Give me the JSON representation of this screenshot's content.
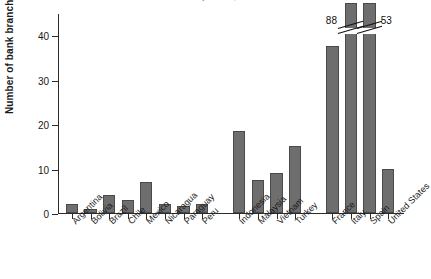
{
  "chart_data": {
    "type": "bar",
    "title": "Bank branches per 100,000 adults",
    "xlabel": "",
    "ylabel": "Number of bank branches",
    "ylim": [
      0,
      45
    ],
    "yticks": [
      0,
      10,
      20,
      30,
      40
    ],
    "grid": false,
    "legend": null,
    "bar_color": "#6e6e6e",
    "categories": [
      "Argentina",
      "Bolivia",
      "Brazil",
      "Chile",
      "Mexico",
      "Nicaragua",
      "Paraguay",
      "Peru",
      "Indonesia",
      "Malaysia",
      "Vietnam",
      "Turkey",
      "France",
      "Italy",
      "Spain",
      "United States"
    ],
    "values": [
      2,
      1,
      4,
      3,
      7,
      2,
      1.5,
      2,
      18.5,
      7.5,
      9,
      15,
      37.5,
      88,
      53,
      10
    ],
    "groups": [
      {
        "name": "Latin America",
        "members": [
          "Argentina",
          "Bolivia",
          "Brazil",
          "Chile",
          "Mexico",
          "Nicaragua",
          "Paraguay",
          "Peru"
        ]
      },
      {
        "name": "Asia",
        "members": [
          "Indonesia",
          "Malaysia",
          "Vietnam",
          "Turkey"
        ]
      },
      {
        "name": "High income",
        "members": [
          "France",
          "Italy",
          "Spain",
          "United States"
        ]
      }
    ],
    "annotations": [
      {
        "label": "88",
        "category": "Italy",
        "note": "axis break, true value above plot range"
      },
      {
        "label": "53",
        "category": "Spain",
        "note": "axis break, true value above plot range"
      }
    ]
  },
  "axis": {
    "y_title": "Number of bank branches",
    "tick_labels": [
      "0",
      "10",
      "20",
      "30",
      "40"
    ]
  },
  "labels": {
    "italy_value": "88",
    "spain_value": "53"
  }
}
